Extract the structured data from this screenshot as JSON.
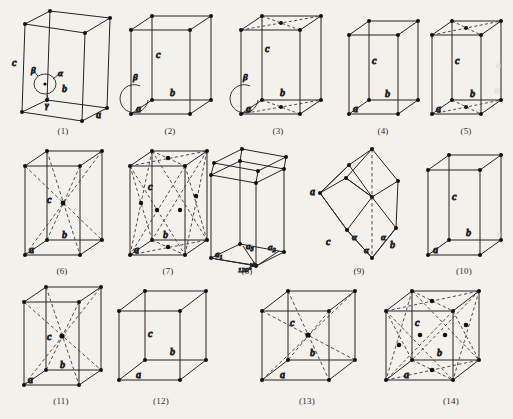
{
  "figure": {
    "background_color": "#f3f1ec",
    "line_color": "#232323",
    "dash_color": "#3a3a3a",
    "node_color": "#111111",
    "footer_note": "",
    "grid": {
      "columns": 5,
      "rows": 3
    }
  },
  "labels": {
    "a": "a",
    "b": "b",
    "c": "c",
    "alpha": "α",
    "beta": "β",
    "gamma": "γ",
    "a1": "a",
    "a1sub": "1",
    "a2": "a",
    "a2sub": "2",
    "a3": "a",
    "a3sub": "3",
    "angle120": "120°"
  },
  "cells": [
    {
      "index": 1,
      "caption": "(1)",
      "system": "triclinic",
      "centering": "primitive",
      "edge_labels": [
        "a",
        "b",
        "c"
      ],
      "angle_labels": [
        "α",
        "β",
        "γ"
      ],
      "has_interior_points": false,
      "has_face_points": false
    },
    {
      "index": 2,
      "caption": "(2)",
      "system": "monoclinic",
      "centering": "primitive",
      "edge_labels": [
        "a",
        "b",
        "c"
      ],
      "angle_labels": [
        "β"
      ],
      "has_interior_points": false,
      "has_face_points": false
    },
    {
      "index": 3,
      "caption": "(3)",
      "system": "monoclinic",
      "centering": "base-centered",
      "edge_labels": [
        "a",
        "b",
        "c"
      ],
      "angle_labels": [
        "β"
      ],
      "has_interior_points": false,
      "has_face_points": true
    },
    {
      "index": 4,
      "caption": "(4)",
      "system": "orthorhombic",
      "centering": "primitive",
      "edge_labels": [
        "a",
        "b",
        "c"
      ],
      "angle_labels": [],
      "has_interior_points": false,
      "has_face_points": false
    },
    {
      "index": 5,
      "caption": "(5)",
      "system": "orthorhombic",
      "centering": "base-centered",
      "edge_labels": [
        "a",
        "b",
        "c"
      ],
      "angle_labels": [],
      "has_interior_points": false,
      "has_face_points": true
    },
    {
      "index": 6,
      "caption": "(6)",
      "system": "orthorhombic",
      "centering": "body-centered",
      "edge_labels": [
        "a",
        "b",
        "c"
      ],
      "angle_labels": [],
      "has_interior_points": true,
      "has_face_points": false
    },
    {
      "index": 7,
      "caption": "(7)",
      "system": "orthorhombic",
      "centering": "face-centered",
      "edge_labels": [
        "a",
        "b",
        "c"
      ],
      "angle_labels": [],
      "has_interior_points": false,
      "has_face_points": true
    },
    {
      "index": 8,
      "caption": "(8)",
      "system": "hexagonal",
      "centering": "primitive",
      "edge_labels": [
        "a",
        "a",
        "a"
      ],
      "angle_labels": [
        "120°"
      ],
      "has_interior_points": false,
      "has_face_points": false
    },
    {
      "index": 9,
      "caption": "(9)",
      "system": "rhombohedral",
      "centering": "primitive",
      "edge_labels": [
        "a",
        "b",
        "c"
      ],
      "angle_labels": [
        "α",
        "α",
        "α"
      ],
      "has_interior_points": false,
      "has_face_points": false
    },
    {
      "index": 10,
      "caption": "(10)",
      "system": "tetragonal",
      "centering": "primitive",
      "edge_labels": [
        "a",
        "b",
        "c"
      ],
      "angle_labels": [],
      "has_interior_points": false,
      "has_face_points": false
    },
    {
      "index": 11,
      "caption": "(11)",
      "system": "tetragonal",
      "centering": "body-centered",
      "edge_labels": [
        "a",
        "b",
        "c"
      ],
      "angle_labels": [],
      "has_interior_points": true,
      "has_face_points": false
    },
    {
      "index": 12,
      "caption": "(12)",
      "system": "cubic",
      "centering": "primitive",
      "edge_labels": [
        "a",
        "b",
        "c"
      ],
      "angle_labels": [],
      "has_interior_points": false,
      "has_face_points": false
    },
    {
      "index": 13,
      "caption": "(13)",
      "system": "cubic",
      "centering": "body-centered",
      "edge_labels": [
        "a",
        "b",
        "c"
      ],
      "angle_labels": [],
      "has_interior_points": true,
      "has_face_points": false
    },
    {
      "index": 14,
      "caption": "(14)",
      "system": "cubic",
      "centering": "face-centered",
      "edge_labels": [
        "a",
        "b",
        "c"
      ],
      "angle_labels": [],
      "has_interior_points": false,
      "has_face_points": true
    }
  ]
}
